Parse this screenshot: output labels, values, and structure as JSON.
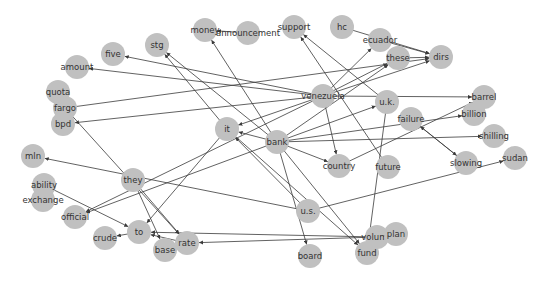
{
  "diagram": {
    "type": "directed-graph",
    "node_color": "#c0c0c0",
    "edge_color": "#3a3a3a",
    "label_color": "#333333",
    "node_radius": 12,
    "nodes": [
      {
        "id": "money",
        "label": "money",
        "x": 205,
        "y": 30
      },
      {
        "id": "announcement",
        "label": "announcement",
        "x": 248,
        "y": 33
      },
      {
        "id": "support",
        "label": "support",
        "x": 294,
        "y": 27
      },
      {
        "id": "hc",
        "label": "hc",
        "x": 342,
        "y": 27
      },
      {
        "id": "ecuador",
        "label": "ecuador",
        "x": 380,
        "y": 40
      },
      {
        "id": "these",
        "label": "these",
        "x": 398,
        "y": 58
      },
      {
        "id": "dirs",
        "label": "dirs",
        "x": 441,
        "y": 57
      },
      {
        "id": "stg",
        "label": "stg",
        "x": 157,
        "y": 45
      },
      {
        "id": "five",
        "label": "five",
        "x": 113,
        "y": 54
      },
      {
        "id": "amount",
        "label": "amount",
        "x": 77,
        "y": 67
      },
      {
        "id": "quota",
        "label": "quota",
        "x": 58,
        "y": 92
      },
      {
        "id": "fargo",
        "label": "fargo",
        "x": 65,
        "y": 108
      },
      {
        "id": "bpd",
        "label": "bpd",
        "x": 63,
        "y": 124
      },
      {
        "id": "venezuela",
        "label": "venezuela",
        "x": 323,
        "y": 96
      },
      {
        "id": "uk",
        "label": "u.k.",
        "x": 387,
        "y": 102
      },
      {
        "id": "barrel",
        "label": "barrel",
        "x": 484,
        "y": 97
      },
      {
        "id": "billion",
        "label": "billion",
        "x": 474,
        "y": 114
      },
      {
        "id": "failure",
        "label": "failure",
        "x": 411,
        "y": 119
      },
      {
        "id": "shilling",
        "label": "shilling",
        "x": 494,
        "y": 136
      },
      {
        "id": "it",
        "label": "it",
        "x": 227,
        "y": 129
      },
      {
        "id": "bank",
        "label": "bank",
        "x": 277,
        "y": 142
      },
      {
        "id": "mln",
        "label": "mln",
        "x": 33,
        "y": 156
      },
      {
        "id": "they",
        "label": "they",
        "x": 133,
        "y": 180
      },
      {
        "id": "ability",
        "label": "ability",
        "x": 44,
        "y": 185
      },
      {
        "id": "exchange",
        "label": "exchange",
        "x": 43,
        "y": 200
      },
      {
        "id": "official",
        "label": "official",
        "x": 75,
        "y": 217
      },
      {
        "id": "country",
        "label": "country",
        "x": 339,
        "y": 166
      },
      {
        "id": "future",
        "label": "future",
        "x": 388,
        "y": 167
      },
      {
        "id": "slowing",
        "label": "slowing",
        "x": 466,
        "y": 163
      },
      {
        "id": "sudan",
        "label": "sudan",
        "x": 515,
        "y": 158
      },
      {
        "id": "us",
        "label": "u.s.",
        "x": 308,
        "y": 211
      },
      {
        "id": "to",
        "label": "to",
        "x": 139,
        "y": 232
      },
      {
        "id": "crude",
        "label": "crude",
        "x": 105,
        "y": 238
      },
      {
        "id": "rate",
        "label": "rate",
        "x": 187,
        "y": 243
      },
      {
        "id": "base",
        "label": "base",
        "x": 165,
        "y": 250
      },
      {
        "id": "volume",
        "label": "volume",
        "x": 377,
        "y": 237
      },
      {
        "id": "plan",
        "label": "plan",
        "x": 396,
        "y": 234
      },
      {
        "id": "board",
        "label": "board",
        "x": 310,
        "y": 256
      },
      {
        "id": "fund",
        "label": "fund",
        "x": 367,
        "y": 253
      }
    ],
    "edges": [
      {
        "source": "announcement",
        "target": "money"
      },
      {
        "source": "bank",
        "target": "money"
      },
      {
        "source": "hc",
        "target": "dirs"
      },
      {
        "source": "ecuador",
        "target": "dirs"
      },
      {
        "source": "these",
        "target": "dirs"
      },
      {
        "source": "venezuela",
        "target": "dirs"
      },
      {
        "source": "fargo",
        "target": "dirs"
      },
      {
        "source": "venezuela",
        "target": "ecuador"
      },
      {
        "source": "venezuela",
        "target": "these"
      },
      {
        "source": "bank",
        "target": "these"
      },
      {
        "source": "uk",
        "target": "support"
      },
      {
        "source": "future",
        "target": "support"
      },
      {
        "source": "bank",
        "target": "stg"
      },
      {
        "source": "it",
        "target": "stg"
      },
      {
        "source": "venezuela",
        "target": "five"
      },
      {
        "source": "venezuela",
        "target": "amount"
      },
      {
        "source": "venezuela",
        "target": "bpd"
      },
      {
        "source": "venezuela",
        "target": "barrel"
      },
      {
        "source": "venezuela",
        "target": "it"
      },
      {
        "source": "venezuela",
        "target": "country"
      },
      {
        "source": "venezuela",
        "target": "official"
      },
      {
        "source": "bank",
        "target": "it"
      },
      {
        "source": "bank",
        "target": "billion"
      },
      {
        "source": "bank",
        "target": "shilling"
      },
      {
        "source": "bank",
        "target": "uk"
      },
      {
        "source": "bank",
        "target": "country"
      },
      {
        "source": "bank",
        "target": "official"
      },
      {
        "source": "bank",
        "target": "board"
      },
      {
        "source": "bank",
        "target": "fund"
      },
      {
        "source": "uk",
        "target": "fund"
      },
      {
        "source": "failure",
        "target": "slowing"
      },
      {
        "source": "slowing",
        "target": "failure"
      },
      {
        "source": "country",
        "target": "barrel"
      },
      {
        "source": "us",
        "target": "sudan"
      },
      {
        "source": "us",
        "target": "mln"
      },
      {
        "source": "us",
        "target": "it"
      },
      {
        "source": "it",
        "target": "to"
      },
      {
        "source": "fargo",
        "target": "rate"
      },
      {
        "source": "they",
        "target": "base"
      },
      {
        "source": "they",
        "target": "rate"
      },
      {
        "source": "ability",
        "target": "to"
      },
      {
        "source": "to",
        "target": "crude"
      },
      {
        "source": "rate",
        "target": "to"
      },
      {
        "source": "volume",
        "target": "to"
      },
      {
        "source": "volume",
        "target": "rate"
      },
      {
        "source": "it",
        "target": "fund"
      }
    ]
  }
}
